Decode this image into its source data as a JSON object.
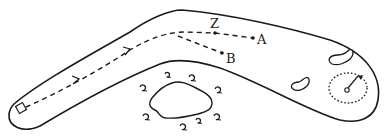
{
  "diagram": {
    "type": "golf-hole-layout",
    "colors": {
      "ink": "#1a1a1a",
      "background": "#ffffff"
    },
    "labels": {
      "z": "Z",
      "a": "A",
      "b": "B"
    },
    "elements": {
      "tee": "tee-box-square",
      "fairway": "dogleg-fairway-outline",
      "path": "dashed-shot-path-with-arrows",
      "green": "dotted-green-circle",
      "flag": "flag-pin",
      "bunkers": 2,
      "water_hazard": "pond",
      "trees": 8
    }
  }
}
